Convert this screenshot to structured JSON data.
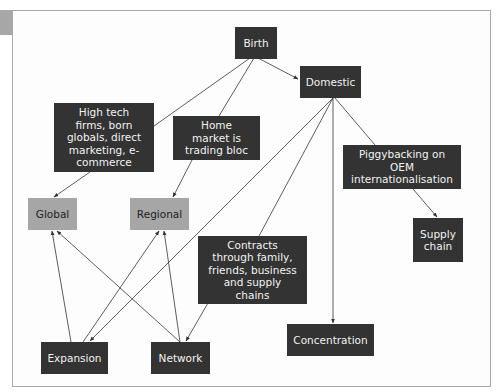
{
  "diagram": {
    "colors": {
      "dark_node": "#333333",
      "light_node": "#a6a6a6",
      "line": "#333333",
      "frame": "#a9a9a9"
    },
    "nodes": {
      "birth": "Birth",
      "domestic": "Domestic",
      "high_tech": "High tech firms, born globals, direct marketing, e-commerce",
      "home_market": "Home market is trading bloc",
      "global": "Global",
      "regional": "Regional",
      "piggybacking": "Piggybacking on OEM internationalisation",
      "supply_chain": "Supply chain",
      "contracts": "Contracts through family, friends, business and supply chains",
      "expansion": "Expansion",
      "network": "Network",
      "concentration": "Concentration"
    },
    "edges": [
      {
        "from": "Birth",
        "to": "High tech firms, born globals, direct marketing, e-commerce",
        "arrow": false
      },
      {
        "from": "Birth",
        "to": "Home market is trading bloc",
        "arrow": false
      },
      {
        "from": "Birth",
        "to": "Domestic",
        "arrow": true
      },
      {
        "from": "High tech firms, born globals, direct marketing, e-commerce",
        "to": "Global",
        "arrow": true
      },
      {
        "from": "Home market is trading bloc",
        "to": "Regional",
        "arrow": true
      },
      {
        "from": "Domestic",
        "to": "Expansion",
        "arrow": true
      },
      {
        "from": "Domestic",
        "to": "Contracts through family, friends, business and supply chains",
        "arrow": false
      },
      {
        "from": "Domestic",
        "to": "Concentration",
        "arrow": true
      },
      {
        "from": "Domestic",
        "to": "Piggybacking on OEM internationalisation",
        "arrow": false
      },
      {
        "from": "Piggybacking on OEM internationalisation",
        "to": "Supply chain",
        "arrow": true
      },
      {
        "from": "Contracts through family, friends, business and supply chains",
        "to": "Network",
        "arrow": true
      },
      {
        "from": "Expansion",
        "to": "Global",
        "arrow": true
      },
      {
        "from": "Expansion",
        "to": "Regional",
        "arrow": true
      },
      {
        "from": "Network",
        "to": "Global",
        "arrow": true
      },
      {
        "from": "Network",
        "to": "Regional",
        "arrow": true
      }
    ]
  }
}
